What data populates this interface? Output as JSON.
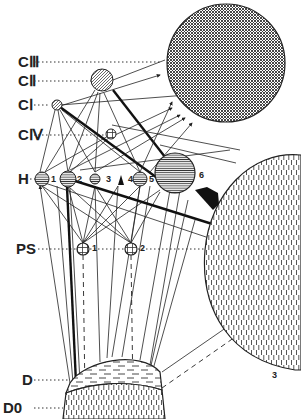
{
  "diagram": {
    "type": "compartment-flow-diagram",
    "levels": [
      {
        "id": "CIII",
        "label": "CⅢ"
      },
      {
        "id": "CII",
        "label": "CⅡ"
      },
      {
        "id": "CI",
        "label": "CⅠ"
      },
      {
        "id": "CIV",
        "label": "CⅣ"
      },
      {
        "id": "H",
        "label": "H"
      },
      {
        "id": "PS",
        "label": "PS"
      },
      {
        "id": "D",
        "label": "D"
      },
      {
        "id": "D0",
        "label": "D0"
      }
    ],
    "nodes": {
      "H": [
        "1",
        "2",
        "3",
        "4",
        "5",
        "6"
      ],
      "PS": [
        "1",
        "2"
      ],
      "large": "3"
    },
    "colors": {
      "ink": "#222222",
      "background": "#ffffff"
    }
  }
}
